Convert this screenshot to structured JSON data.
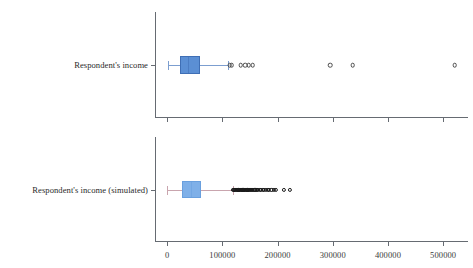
{
  "figure": {
    "background": "#ffffff",
    "axis_color": "#666b72",
    "text_color": "#2a2a2a"
  },
  "chart_data": {
    "type": "boxplot",
    "orientation": "horizontal",
    "title": "",
    "xlabel": "",
    "ylabel": "",
    "xlim": [
      -22000,
      545000
    ],
    "grid": false,
    "legend": false,
    "xticks": [
      0,
      100000,
      200000,
      300000,
      400000,
      500000
    ],
    "xticklabels": [
      "0",
      "100000",
      "200000",
      "300000",
      "400000",
      "500000"
    ],
    "panels": [
      {
        "panel_id": "observed",
        "category": "Respondent's income",
        "box_color": "#5b8fd4",
        "box_edge_color": "#3f6fb5",
        "whisker_color": "#7c9ed0",
        "flier_edge_color": "#4a4a4a",
        "stats": {
          "whisker_low": 1200,
          "q1": 24000,
          "median": 38000,
          "q3": 59500,
          "whisker_high": 110000
        },
        "fliers": [
          113000,
          117000,
          133000,
          141000,
          148000,
          155000,
          295000,
          336000,
          521000
        ],
        "show_xticklabels": false
      },
      {
        "panel_id": "simulated",
        "category": "Respondent's income (simulated)",
        "box_color": "#7fb0e8",
        "box_edge_color": "#6aa0de",
        "whisker_color": "#c9a5ae",
        "flier_edge_color": "#1a1a1a",
        "stats": {
          "whisker_low": 500,
          "q1": 27000,
          "median": 44000,
          "q3": 62000,
          "whisker_high": 119000
        },
        "fliers": [
          120000,
          121500,
          123000,
          124500,
          126000,
          127500,
          129000,
          130500,
          132000,
          133500,
          135000,
          136500,
          138000,
          139500,
          141000,
          142500,
          144000,
          145500,
          147000,
          148500,
          150000,
          152000,
          154000,
          156000,
          158000,
          160000,
          162500,
          165000,
          167500,
          170000,
          173000,
          176000,
          179000,
          182000,
          185000,
          189000,
          193000,
          197000,
          212000,
          222000
        ],
        "show_xticklabels": true
      }
    ]
  }
}
